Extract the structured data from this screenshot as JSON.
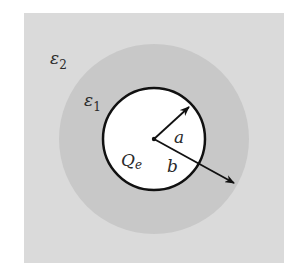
{
  "diagram": {
    "labels": {
      "outer_medium": "ε",
      "outer_medium_sub": "2",
      "shell": "ε",
      "shell_sub": "1",
      "charge": "Q",
      "charge_sub": "e",
      "inner_radius": "a",
      "outer_radius": "b"
    },
    "colors": {
      "outer_medium": "#dadada",
      "shell": "#c8c8c8",
      "sphere": "#ffffff",
      "stroke": "#111111"
    }
  }
}
